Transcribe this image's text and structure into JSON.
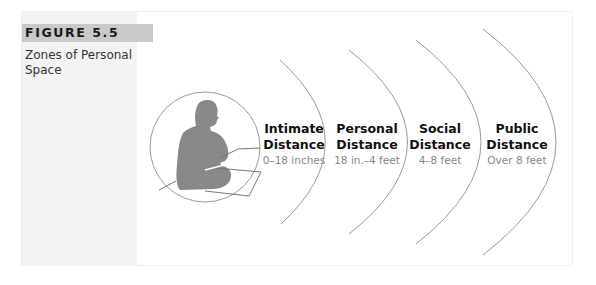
{
  "figure": {
    "label": "FIGURE 5.5",
    "caption": "Zones of Personal Space"
  },
  "zones": [
    {
      "title_line1": "Intimate",
      "title_line2": "Distance",
      "range": "0–18 inches"
    },
    {
      "title_line1": "Personal",
      "title_line2": "Distance",
      "range": "18 in.–4 feet"
    },
    {
      "title_line1": "Social",
      "title_line2": "Distance",
      "range": "4–8 feet"
    },
    {
      "title_line1": "Public",
      "title_line2": "Distance",
      "range": "Over 8 feet"
    }
  ],
  "colors": {
    "label_band": "#c9c9c9",
    "sidebar": "#f3f3f3",
    "silhouette": "#888888",
    "arc": "#9a9a9a"
  }
}
